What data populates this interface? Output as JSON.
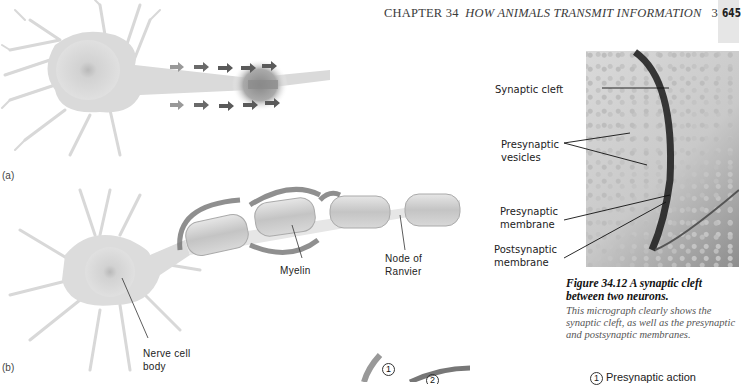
{
  "header": {
    "chapter": "CHAPTER 34",
    "title": "HOW ANIMALS TRANSMIT INFORMATION",
    "section_page": "34-9",
    "page_number": "645"
  },
  "figure_left": {
    "panel_a_label": "(a)",
    "panel_b_label": "(b)",
    "labels": {
      "myelin": "Myelin",
      "node_of_ranvier_1": "Node of",
      "node_of_ranvier_2": "Ranvier",
      "nerve_cell_body_1": "Nerve cell",
      "nerve_cell_body_2": "body"
    }
  },
  "micrograph": {
    "labels": {
      "synaptic_cleft": "Synaptic cleft",
      "presynaptic_vesicles_1": "Presynaptic",
      "presynaptic_vesicles_2": "vesicles",
      "presynaptic_membrane_1": "Presynaptic",
      "presynaptic_membrane_2": "membrane",
      "postsynaptic_membrane_1": "Postsynaptic",
      "postsynaptic_membrane_2": "membrane"
    },
    "caption_title": "Figure 34.12 A synaptic cleft between two neurons.",
    "caption_body": "This micrograph clearly shows the synaptic cleft, as well as the presynaptic and postsynaptic membranes."
  },
  "bottom_diagram": {
    "step_number_1": "1",
    "step_number_2": "2",
    "legend_number": "1",
    "legend_label": "Presynaptic action"
  },
  "colors": {
    "neuron_gray": "#d4d4d4",
    "arrow_gray": "#5a5a5a",
    "page_tab": "#e6e6e6"
  }
}
